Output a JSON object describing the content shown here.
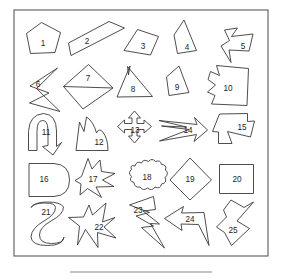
{
  "figure": {
    "title": "",
    "frame": {
      "x": 14,
      "y": 10,
      "width": 254,
      "height": 246
    },
    "rule": {
      "x1": 70,
      "y1": 272,
      "x2": 212,
      "y2": 272
    },
    "stroke_color": "#3a3a3a",
    "frame_color": "#5a5a5a",
    "fill_color": "#ffffff",
    "label_color": "#1c1c1c"
  },
  "shapes": [
    {
      "id": 1,
      "label": "1",
      "name": "pentagon",
      "label_x": 43,
      "label_y": 44,
      "d": "M 41.5 22.5 L 60.5 32.5 L 55.0 52.5 L 30.5 53.5 L 26.5 33.5 Z"
    },
    {
      "id": 2,
      "label": "2",
      "name": "slanted-thin-quadrilateral",
      "label_x": 87,
      "label_y": 42,
      "d": "M 124.5 28.0 L 71.0 55.5 L 68.5 43.0 L 109.0 21.5 Z"
    },
    {
      "id": 3,
      "label": "3",
      "name": "irregular-quadrilateral",
      "label_x": 143,
      "label_y": 47,
      "d": "M 137.5 29.5 L 158.5 36.5 L 150.5 55.0 L 124.0 50.5 Z"
    },
    {
      "id": 4,
      "label": "4",
      "name": "concave-curved-triangle",
      "label_x": 187,
      "label_y": 48,
      "d": "M 184.0 20.0 L 196.5 50.5 L 177.5 53.5 L 174.0 35.0 Z"
    },
    {
      "id": 5,
      "label": "5",
      "name": "concave-arrow-star",
      "label_x": 243,
      "label_y": 47,
      "d": "M 224.5 30.0 L 237.5 28.0 L 231.5 36.5 L 253.0 34.0 L 249.0 51.0 L 229.0 50.0 L 231.0 62.5 L 221.0 46.0 L 229.5 40.5 Z"
    },
    {
      "id": 6,
      "label": "6",
      "name": "self-intersecting-zigzag",
      "label_x": 38,
      "label_y": 85,
      "d": "M 57.5 68.0 L 30.0 86.0 L 49.0 93.0 L 29.5 103.0 L 60.0 111.5 L 36.5 88.5 Z"
    },
    {
      "id": 7,
      "label": "7",
      "name": "kite-with-chord",
      "label_x": 88,
      "label_y": 79,
      "d": "M 88.5 64.5 L 113.0 88.0 L 83.0 109.0 L 63.5 86.5 Z M 63.5 86.5 L 113.0 88.0"
    },
    {
      "id": 8,
      "label": "8",
      "name": "obtuse-triangle-with-notch",
      "label_x": 133,
      "label_y": 90,
      "d": "M 130.0 66.0 L 128.5 75.0 L 127.5 66.5 L 152.5 96.5 L 117.0 97.0 Z"
    },
    {
      "id": 9,
      "label": "9",
      "name": "curved-quadrilateral",
      "label_x": 177,
      "label_y": 88,
      "d": "M 179.0 66.0 L 189.0 92.5 L 169.0 95.5 L 166.5 77.0 Z"
    },
    {
      "id": 10,
      "label": "10",
      "name": "wavy-blob-polygon",
      "label_x": 228,
      "label_y": 89,
      "d": "M 210.5 71.5 L 219.5 75.5 L 216.5 65.5 L 248.5 68.5 L 247.0 105.5 L 211.5 104.0 L 215.0 95.5 L 207.5 92.0 L 215.5 85.0 L 208.0 79.5 Z"
    },
    {
      "id": 11,
      "label": "11",
      "name": "curved-hook-arrow",
      "label_x": 46,
      "label_y": 133,
      "d": "M 28.5 150.5 L 28.5 131.5 Q 29.5 114.5 43.5 113.5 Q 56.5 114.5 56.5 131.0 L 56.5 146.5 L 61.5 142.5 L 53.0 155.0 L 42.5 146.5 L 48.0 145.5 L 48.0 130.0 Q 47.5 120.0 42.5 120.5 Q 37.0 120.5 37.0 131.5 L 37.0 150.5 Z"
    },
    {
      "id": 12,
      "label": "12",
      "name": "mountain-peak-shape",
      "label_x": 99,
      "label_y": 143,
      "d": "M 76.0 150.5 L 79.5 122.0 L 84.0 131.5 L 86.5 117.0 Q 93.5 121.5 96.5 133.0 Q 99.0 128.0 102.5 131.5 Q 108.0 138.5 108.0 150.5 Z"
    },
    {
      "id": 13,
      "label": "13",
      "name": "four-way-move-arrow",
      "label_x": 135,
      "label_y": 131,
      "d": "M 134.5 111.0 L 140.5 118.0 L 137.0 118.0 L 137.0 123.5 L 144.0 123.5 L 144.0 120.0 L 151.5 126.5 L 144.0 133.0 L 144.0 129.5 L 137.0 129.5 L 137.0 136.0 L 140.5 136.0 L 134.5 143.0 L 128.5 136.0 L 132.0 136.0 L 132.0 129.5 L 124.5 129.5 L 124.5 133.0 L 117.5 126.5 L 124.5 120.0 L 124.5 123.5 L 132.0 123.5 L 132.0 118.0 L 128.5 118.0 Z"
    },
    {
      "id": 14,
      "label": "14",
      "name": "double-barb-arrow",
      "label_x": 188,
      "label_y": 131,
      "d": "M 159.0 120.5 L 197.0 124.5 L 194.5 117.5 L 207.5 130.0 L 194.0 141.5 L 196.5 134.5 L 159.5 141.0 L 189.0 129.5 L 161.5 126.0 L 186.5 127.0 Z"
    },
    {
      "id": 15,
      "label": "15",
      "name": "concave-arrow-polygon",
      "label_x": 242,
      "label_y": 128,
      "d": "M 219.5 114.0 L 247.5 113.5 L 247.5 121.5 L 254.5 121.0 L 250.5 137.0 L 227.5 131.5 L 232.0 143.5 L 218.5 143.5 L 218.5 132.0 L 212.5 131.5 Z"
    },
    {
      "id": 16,
      "label": "16",
      "name": "d-shape-rounded-right",
      "label_x": 44,
      "label_y": 180,
      "d": "M 29.0 163.5 L 54.0 163.5 Q 69.5 164.5 69.5 180.0 Q 69.5 195.5 54.0 196.5 L 29.0 196.5 Z"
    },
    {
      "id": 17,
      "label": "17",
      "name": "burst-star",
      "label_x": 93,
      "label_y": 180,
      "d": "M 88.0 158.5 L 92.0 169.0 L 100.0 160.0 L 101.5 171.5 L 115.0 173.5 L 102.5 180.0 L 114.0 186.5 L 96.0 187.0 L 101.5 197.5 L 87.5 188.5 L 80.0 195.0 L 81.0 184.0 L 75.0 180.5 L 81.5 176.5 Z"
    },
    {
      "id": 18,
      "label": "18",
      "name": "cloud-scalloped-blob",
      "label_x": 147,
      "label_y": 178,
      "d": "M 135.0 166.0 Q 136.5 160.5 141.5 163.0 Q 143.5 158.5 148.5 161.5 Q 152.0 157.5 155.5 161.5 Q 160.5 159.5 161.5 164.5 Q 167.0 164.5 165.5 170.0 Q 169.5 173.5 165.0 177.5 Q 167.5 183.0 161.5 184.0 Q 160.5 189.5 155.0 187.0 Q 152.0 191.5 147.5 188.0 Q 143.0 191.5 140.0 187.0 Q 134.5 188.0 134.0 182.5 Q 128.5 181.0 131.5 176.5 Q 127.5 172.5 131.5 169.5 Q 129.5 164.5 135.0 166.0 Z"
    },
    {
      "id": 19,
      "label": "19",
      "name": "diamond",
      "label_x": 190,
      "label_y": 180,
      "d": "M 190.0 158.0 L 211.5 180.0 L 190.0 200.0 L 170.0 180.0 Z"
    },
    {
      "id": 20,
      "label": "20",
      "name": "square",
      "label_x": 237,
      "label_y": 180,
      "d": "M 219.5 164.5 L 253.5 164.5 L 253.5 193.5 L 219.5 193.5 Z"
    },
    {
      "id": 21,
      "label": "21",
      "name": "hourglass-goblet",
      "label_x": 46,
      "label_y": 213,
      "d": "M 31.0 207.5 Q 35.0 202.0 47.5 202.0 Q 60.5 202.0 63.5 207.0 Q 63.5 214.5 51.0 221.0 Q 39.5 227.5 39.5 235.0 Q 39.5 243.5 51.5 243.5 Q 63.5 243.5 64.0 237.0 Q 63.0 245.5 47.5 245.5 Q 31.5 245.5 31.0 237.0 Q 31.5 228.0 44.0 221.0 Q 55.5 214.5 55.5 207.5 Q 55.5 203.0 44.5 203.0 Q 33.0 203.0 31.0 207.5 Z"
    },
    {
      "id": 22,
      "label": "22",
      "name": "star-arrow-composite",
      "label_x": 99,
      "label_y": 228,
      "d": "M 89.0 205.0 L 92.5 215.0 L 106.0 203.0 L 102.5 222.0 L 115.0 217.5 L 104.0 227.0 L 116.0 238.0 L 97.5 232.5 L 98.0 247.5 L 85.5 229.5 L 77.5 245.0 L 79.5 226.0 L 68.5 217.5 L 83.5 217.0 Z"
    },
    {
      "id": 23,
      "label": "23",
      "name": "lightning-bolt",
      "label_x": 138,
      "label_y": 211,
      "d": "M 153.5 196.5 L 129.5 205.0 L 149.5 212.5 L 136.0 216.0 L 153.5 226.0 L 141.5 227.5 L 164.5 248.0 L 150.5 223.5 L 159.5 224.0 L 143.0 211.0 L 155.5 209.5 Z"
    },
    {
      "id": 24,
      "label": "24",
      "name": "left-pointing-arrow",
      "label_x": 190,
      "label_y": 220,
      "d": "M 164.5 218.5 L 183.5 206.5 L 181.5 213.0 L 204.0 212.5 L 209.0 245.5 L 198.5 224.5 L 181.0 224.0 L 182.0 230.5 Z"
    },
    {
      "id": 25,
      "label": "25",
      "name": "zigzag-z-polygon",
      "label_x": 233,
      "label_y": 231,
      "d": "M 231.0 200.0 L 244.0 207.5 L 253.5 202.0 L 237.0 221.0 L 249.5 228.5 L 231.5 245.5 L 224.5 232.5 L 216.5 227.0 L 226.5 217.0 L 223.5 210.0 Z"
    }
  ]
}
